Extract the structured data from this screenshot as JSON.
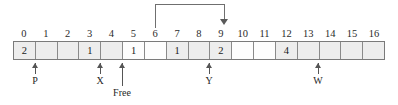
{
  "diagram": {
    "type": "array-memory-pointer-diagram",
    "indices": [
      "0",
      "1",
      "2",
      "3",
      "4",
      "5",
      "6",
      "7",
      "8",
      "9",
      "10",
      "11",
      "12",
      "13",
      "14",
      "15",
      "16"
    ],
    "cells": [
      {
        "index": 0,
        "value": "2",
        "shaded": true
      },
      {
        "index": 1,
        "value": "",
        "shaded": true
      },
      {
        "index": 2,
        "value": "",
        "shaded": true
      },
      {
        "index": 3,
        "value": "1",
        "shaded": true
      },
      {
        "index": 4,
        "value": "",
        "shaded": true
      },
      {
        "index": 5,
        "value": "1",
        "shaded": false
      },
      {
        "index": 6,
        "value": "",
        "shaded": false
      },
      {
        "index": 7,
        "value": "1",
        "shaded": true
      },
      {
        "index": 8,
        "value": "",
        "shaded": true
      },
      {
        "index": 9,
        "value": "2",
        "shaded": true
      },
      {
        "index": 10,
        "value": "",
        "shaded": false
      },
      {
        "index": 11,
        "value": "",
        "shaded": false
      },
      {
        "index": 12,
        "value": "4",
        "shaded": true
      },
      {
        "index": 13,
        "value": "",
        "shaded": true
      },
      {
        "index": 14,
        "value": "",
        "shaded": true
      },
      {
        "index": 15,
        "value": "",
        "shaded": true
      },
      {
        "index": 16,
        "value": "",
        "shaded": true
      }
    ],
    "pointers": [
      {
        "label": "P",
        "target_index": 1,
        "long": false
      },
      {
        "label": "X",
        "target_index": 4,
        "long": false
      },
      {
        "label": "Free",
        "target_index": 5,
        "long": true
      },
      {
        "label": "Y",
        "target_index": 8,
        "long": false
      },
      {
        "label": "W",
        "target_index": 13,
        "long": false
      }
    ],
    "link_arrow": {
      "from_index": 6,
      "to_index": 9,
      "direction": "down"
    },
    "colors": {
      "cell_shaded": "#ededed",
      "cell_blank": "#fdfdfd",
      "border": "#7a7a7a",
      "arrow": "#555555",
      "text": "#1a1a1a"
    }
  }
}
